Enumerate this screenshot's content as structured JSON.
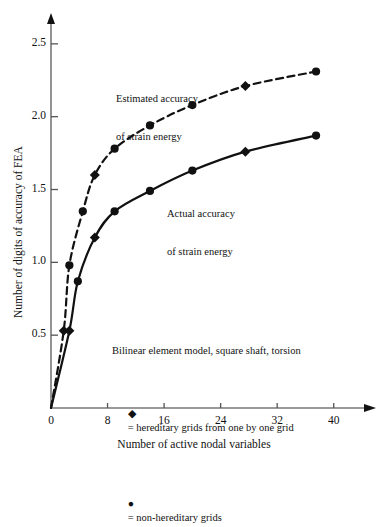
{
  "chart_data": {
    "type": "line",
    "title": "",
    "xlabel": "Number of active nodal variables",
    "ylabel": "Number of digits of accuracy of FEA",
    "xlim": [
      0,
      44
    ],
    "ylim": [
      0,
      2.65
    ],
    "xticks": [
      0,
      8,
      16,
      24,
      32,
      40
    ],
    "xtick_labels": [
      "0",
      "8",
      "16",
      "24",
      "32",
      "40"
    ],
    "yticks": [
      0.5,
      1.0,
      1.5,
      2.0,
      2.5
    ],
    "ytick_labels": [
      "0.5",
      "1.0",
      "1.5",
      "2.0",
      "2.5"
    ],
    "grid": false,
    "legend_position": "inside-lower-center",
    "series": [
      {
        "name": "Estimated accuracy of strain energy",
        "style": "dashed",
        "points": [
          {
            "x": 0.0,
            "y": 0.0,
            "marker": "none"
          },
          {
            "x": 1.8,
            "y": 0.53,
            "marker": "diamond"
          },
          {
            "x": 2.6,
            "y": 0.98,
            "marker": "circle"
          },
          {
            "x": 4.5,
            "y": 1.35,
            "marker": "circle"
          },
          {
            "x": 6.2,
            "y": 1.6,
            "marker": "diamond"
          },
          {
            "x": 9.0,
            "y": 1.78,
            "marker": "circle"
          },
          {
            "x": 14.0,
            "y": 1.94,
            "marker": "circle"
          },
          {
            "x": 20.0,
            "y": 2.08,
            "marker": "circle"
          },
          {
            "x": 27.5,
            "y": 2.21,
            "marker": "diamond"
          },
          {
            "x": 37.5,
            "y": 2.31,
            "marker": "circle"
          }
        ]
      },
      {
        "name": "Actual accuracy of strain energy",
        "style": "solid",
        "points": [
          {
            "x": 0.0,
            "y": 0.0,
            "marker": "none"
          },
          {
            "x": 2.6,
            "y": 0.53,
            "marker": "diamond"
          },
          {
            "x": 3.8,
            "y": 0.87,
            "marker": "circle"
          },
          {
            "x": 6.2,
            "y": 1.17,
            "marker": "diamond"
          },
          {
            "x": 9.0,
            "y": 1.35,
            "marker": "circle"
          },
          {
            "x": 14.0,
            "y": 1.49,
            "marker": "circle"
          },
          {
            "x": 20.0,
            "y": 1.63,
            "marker": "circle"
          },
          {
            "x": 27.5,
            "y": 1.76,
            "marker": "diamond"
          },
          {
            "x": 37.5,
            "y": 1.87,
            "marker": "circle"
          }
        ]
      }
    ],
    "annotations": [
      {
        "id": "estimated",
        "line1": "Estimated accuracy",
        "line2": "of strain energy"
      },
      {
        "id": "actual",
        "line1": "Actual accuracy",
        "line2": "of strain energy"
      }
    ],
    "legend": {
      "caption": "Bilinear element model, square shaft, torsion",
      "entries": [
        {
          "marker": "diamond",
          "label": "= hereditary grids from one by one grid"
        },
        {
          "marker": "circle",
          "label": "= non-hereditary grids"
        }
      ]
    },
    "colors": {
      "ink": "#111111",
      "background": "#ffffff"
    }
  }
}
